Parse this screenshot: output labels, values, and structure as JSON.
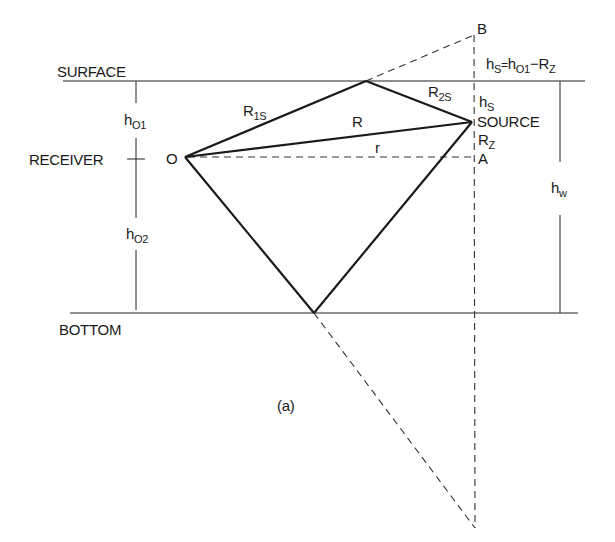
{
  "figure": {
    "caption": "(a)",
    "labels": {
      "surface": "SURFACE",
      "bottom": "BOTTOM",
      "receiver": "RECEIVER",
      "receiver_point": "O",
      "source": "SOURCE",
      "point_b": "B",
      "point_a": "A",
      "r1s_main": "R",
      "r1s_sub": "1S",
      "r2s_main": "R",
      "r2s_sub": "2S",
      "r_direct": "R",
      "r_horizontal": "r",
      "h01_main": "h",
      "h01_sub": "O1",
      "h02_main": "h",
      "h02_sub": "O2",
      "hw_main": "h",
      "hw_sub": "w",
      "hs_main": "h",
      "hs_sub": "S",
      "rz_main": "R",
      "rz_sub": "Z",
      "equation": {
        "lhs_main": "h",
        "lhs_sub": "S",
        "eq": "=",
        "rhs1_main": "h",
        "rhs1_sub": "O1",
        "minus": "−",
        "rhs2_main": "R",
        "rhs2_sub": "Z"
      }
    },
    "colors": {
      "ink": "#1a1a1a",
      "background": "#ffffff"
    }
  }
}
